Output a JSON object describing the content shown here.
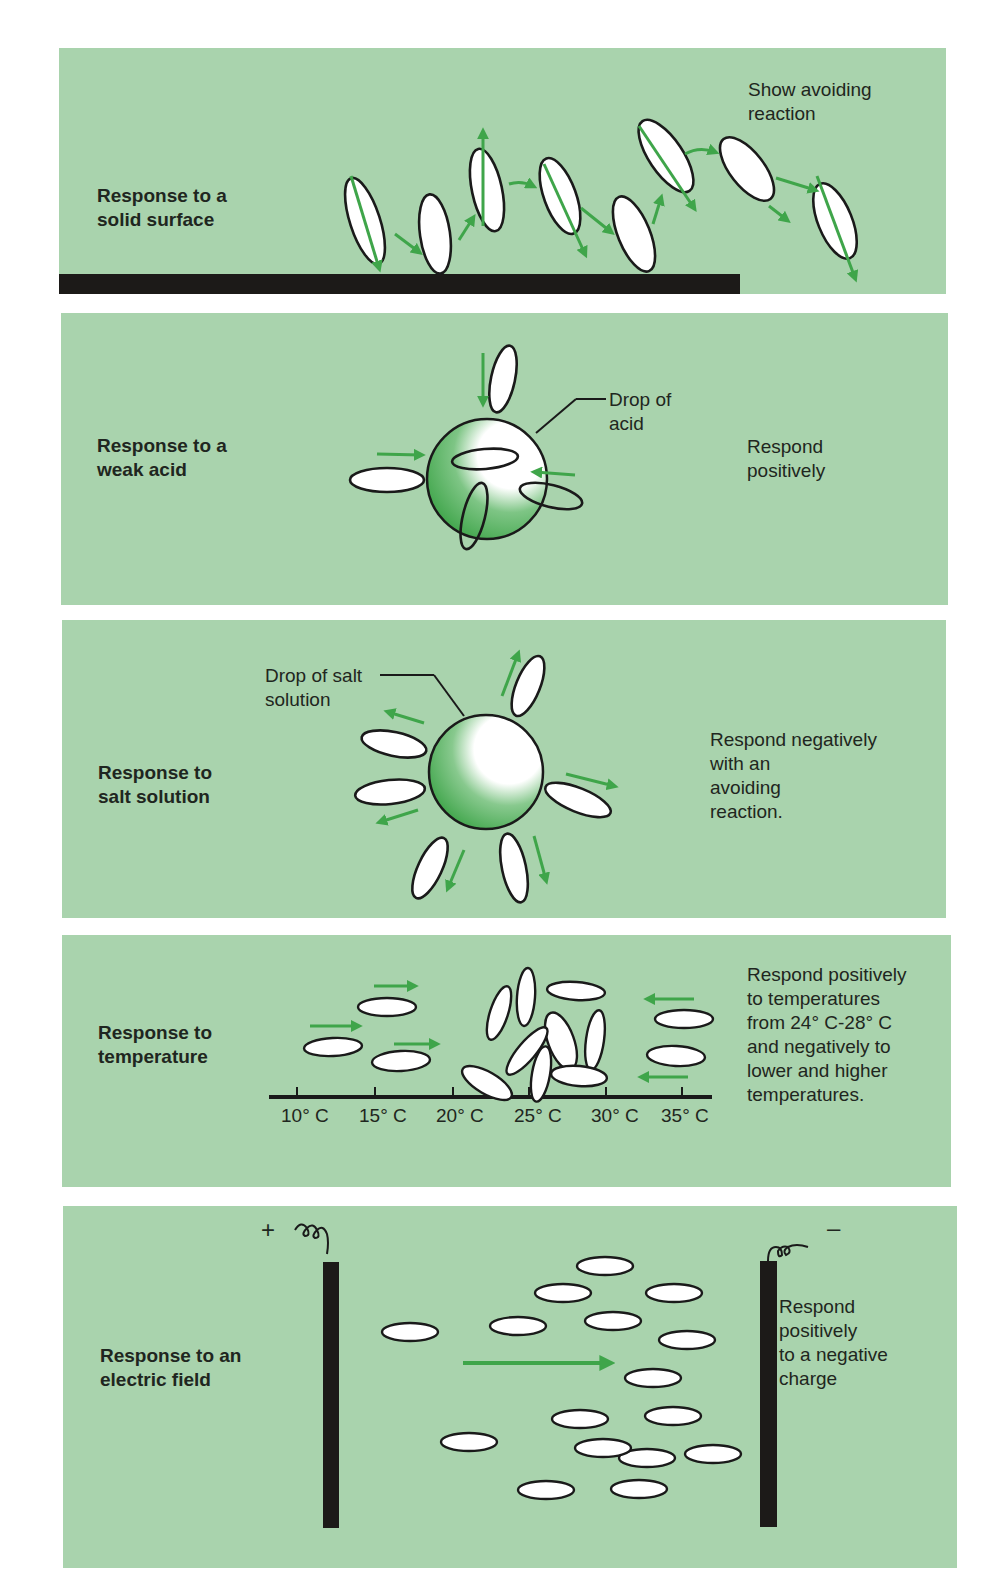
{
  "figure": {
    "colors": {
      "panel_background": "#a9d3ad",
      "arrow_green": "#3fa54a",
      "outline": "#1a1a1a",
      "organism_fill": "#ffffff",
      "page_background": "#ffffff"
    },
    "panels": [
      {
        "id": "solid-surface",
        "label": "Response to a\nsolid surface",
        "description": "Show avoiding\nreaction",
        "elements": [
          "solid-surface-bar",
          "paramecium-path-with-arrows"
        ]
      },
      {
        "id": "weak-acid",
        "label": "Response to a\nweak acid",
        "callout": "Drop of\nacid",
        "description": "Respond\npositively",
        "elements": [
          "acid-drop",
          "paramecia-entering-drop",
          "inward-arrows"
        ]
      },
      {
        "id": "salt-solution",
        "label": "Response to\nsalt solution",
        "callout": "Drop of salt\nsolution",
        "description": "Respond negatively\nwith an\navoiding\nreaction.",
        "elements": [
          "salt-drop",
          "paramecia-around-drop",
          "outward-arrows"
        ]
      },
      {
        "id": "temperature",
        "label": "Response to\ntemperature",
        "description": "Respond positively\nto temperatures\nfrom 24° C-28° C\nand negatively to\nlower and higher\ntemperatures.",
        "axis": {
          "ticks": [
            "10° C",
            "15° C",
            "20° C",
            "25° C",
            "30° C",
            "35° C"
          ]
        }
      },
      {
        "id": "electric-field",
        "label": "Response to an\nelectric field",
        "positive_sign": "+",
        "negative_sign": "–",
        "description": "Respond\npositively\nto a negative\ncharge"
      }
    ]
  }
}
